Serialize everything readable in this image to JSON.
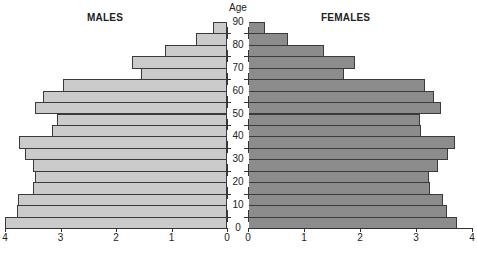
{
  "chart_data": {
    "type": "bar",
    "subtype": "population-pyramid",
    "title": "",
    "left_label": "MALES",
    "right_label": "FEMALES",
    "center_axis_label": "Age",
    "categories": [
      "0-4",
      "5-9",
      "10-14",
      "15-19",
      "20-24",
      "25-29",
      "30-34",
      "35-39",
      "40-44",
      "45-49",
      "50-54",
      "55-59",
      "60-64",
      "65-69",
      "70-74",
      "75-79",
      "80-84",
      "85-89"
    ],
    "series": [
      {
        "name": "MALES",
        "color": "#cbcbcb",
        "values": [
          4.0,
          3.78,
          3.77,
          3.5,
          3.46,
          3.5,
          3.64,
          3.75,
          3.15,
          3.06,
          3.46,
          3.32,
          2.95,
          1.55,
          1.71,
          1.12,
          0.55,
          0.25
        ]
      },
      {
        "name": "FEMALES",
        "color": "#8c8c8c",
        "values": [
          3.73,
          3.55,
          3.48,
          3.25,
          3.23,
          3.39,
          3.57,
          3.7,
          3.09,
          3.07,
          3.45,
          3.32,
          3.16,
          1.71,
          1.91,
          1.36,
          0.71,
          0.3
        ]
      }
    ],
    "age_ticks": [
      "0",
      "10",
      "20",
      "30",
      "40",
      "50",
      "60",
      "70",
      "80",
      "90"
    ],
    "x_ticks_left": [
      "4",
      "3",
      "2",
      "1",
      "0"
    ],
    "x_ticks_right": [
      "0",
      "1",
      "2",
      "3",
      "4"
    ],
    "xlim": [
      0,
      4
    ],
    "grid": false,
    "legend": "none"
  }
}
